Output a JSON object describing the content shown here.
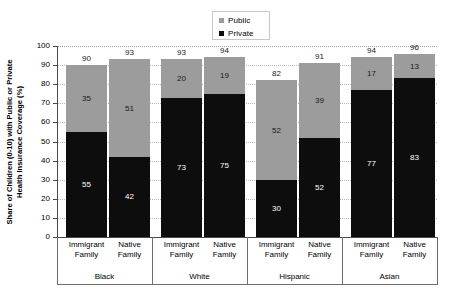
{
  "chart_data": {
    "type": "bar",
    "subtype": "stacked-bar-grouped",
    "title": "",
    "xlabel": "",
    "ylabel": "Share of Children (0-10) with Public or Private Health Insurance Coverage (%)",
    "ylim": [
      0,
      100
    ],
    "yticks": [
      0,
      10,
      20,
      30,
      40,
      50,
      60,
      70,
      80,
      90,
      100
    ],
    "grid": true,
    "legend_position": "top-center",
    "legend": [
      {
        "name": "Public",
        "color": "#9c9c9c"
      },
      {
        "name": "Private",
        "color": "#0d0d0d"
      }
    ],
    "groups": [
      "Black",
      "White",
      "Hispanic",
      "Asian"
    ],
    "categories": [
      "Immigrant Family",
      "Native Family",
      "Immigrant Family",
      "Native Family",
      "Immigrant Family",
      "Native Family",
      "Immigrant Family",
      "Native Family"
    ],
    "series": [
      {
        "name": "Private",
        "color": "#0d0d0d",
        "values": [
          55,
          42,
          73,
          75,
          30,
          52,
          77,
          83
        ]
      },
      {
        "name": "Public",
        "color": "#9c9c9c",
        "values": [
          35,
          51,
          20,
          19,
          52,
          39,
          17,
          13
        ]
      }
    ],
    "totals": [
      90,
      93,
      93,
      94,
      82,
      91,
      94,
      96
    ],
    "bars": [
      {
        "group": "Black",
        "category": "Immigrant Family",
        "private": 55,
        "public": 35,
        "total": 90
      },
      {
        "group": "Black",
        "category": "Native Family",
        "private": 42,
        "public": 51,
        "total": 93
      },
      {
        "group": "White",
        "category": "Immigrant Family",
        "private": 73,
        "public": 20,
        "total": 93
      },
      {
        "group": "White",
        "category": "Native Family",
        "private": 75,
        "public": 19,
        "total": 94
      },
      {
        "group": "Hispanic",
        "category": "Immigrant Family",
        "private": 30,
        "public": 52,
        "total": 82
      },
      {
        "group": "Hispanic",
        "category": "Native Family",
        "private": 52,
        "public": 39,
        "total": 91
      },
      {
        "group": "Asian",
        "category": "Immigrant Family",
        "private": 77,
        "public": 17,
        "total": 94
      },
      {
        "group": "Asian",
        "category": "Native Family",
        "private": 83,
        "public": 13,
        "total": 96
      }
    ]
  },
  "axis": {
    "y_title_line1": "Share of Children (0-10) with Public or Private",
    "y_title_line2": "Health Insurance Coverage (%)",
    "y_tick_labels": [
      "100",
      "90",
      "80",
      "70",
      "60",
      "50",
      "40",
      "30",
      "20",
      "10",
      "0"
    ]
  },
  "legend": {
    "public_label": "Public",
    "private_label": "Private"
  },
  "colors": {
    "public": "#9c9c9c",
    "private": "#0d0d0d",
    "axis": "#4a4a4a",
    "grid": "#b9b9b9",
    "background": "#ffffff"
  }
}
